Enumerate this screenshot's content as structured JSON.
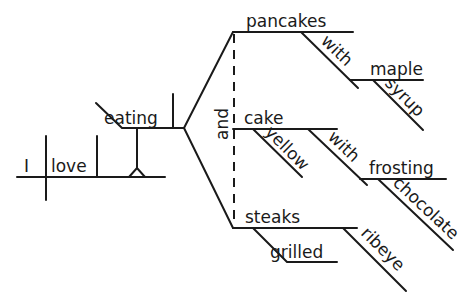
{
  "diagram": {
    "type": "sentence-diagram",
    "sentence": "I love eating pancakes with maple syrup and yellow cake with chocolate frosting and grilled ribeye steaks",
    "subject": "I",
    "verb": "love",
    "gerund": "eating",
    "conjunction": "and",
    "objects": [
      {
        "noun": "pancakes",
        "preposition": "with",
        "prep_object": "maple",
        "prep_object_modifier": "syrup"
      },
      {
        "noun": "cake",
        "modifier": "yellow",
        "preposition": "with",
        "prep_object": "frosting",
        "prep_object_modifier": "chocolate"
      },
      {
        "noun": "steaks",
        "modifiers": [
          "grilled",
          "ribeye"
        ]
      }
    ],
    "labels": {
      "I": "I",
      "love": "love",
      "eating": "eating",
      "and": "and",
      "pancakes": "pancakes",
      "with1": "with",
      "maple": "maple",
      "syrup": "syrup",
      "cake": "cake",
      "yellow": "yellow",
      "with2": "with",
      "frosting": "frosting",
      "chocolate": "chocolate",
      "steaks": "steaks",
      "grilled": "grilled",
      "ribeye": "ribeye"
    },
    "colors": {
      "ink": "#1a1a1a",
      "paper": "#ffffff"
    }
  }
}
